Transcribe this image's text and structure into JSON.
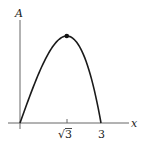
{
  "chart_data": {
    "type": "line",
    "title": "",
    "xlabel": "x",
    "ylabel": "A",
    "function": "A = x(9 - x^2)",
    "x_ticks": [
      {
        "value": 1.7320508,
        "label": "√3"
      },
      {
        "value": 3,
        "label": "3"
      }
    ],
    "sqrt_symbol": "√",
    "sqrt_arg": "3",
    "x_three_label": "3",
    "xlim": [
      0,
      3.4
    ],
    "ylim": [
      0,
      11.5
    ],
    "grid": false,
    "max_point": {
      "x": 1.7320508,
      "y": 10.392,
      "marked": true
    },
    "x": [
      0,
      0.25,
      0.5,
      0.75,
      1.0,
      1.25,
      1.5,
      1.7320508,
      2.0,
      2.25,
      2.5,
      2.75,
      3.0
    ],
    "values": [
      0,
      2.234,
      4.375,
      6.328,
      8.0,
      9.297,
      10.125,
      10.392,
      10.0,
      8.859,
      6.875,
      3.953,
      0
    ],
    "colors": {
      "curve": "#1a1a1a",
      "axes": "#555555",
      "point": "#111111"
    }
  }
}
